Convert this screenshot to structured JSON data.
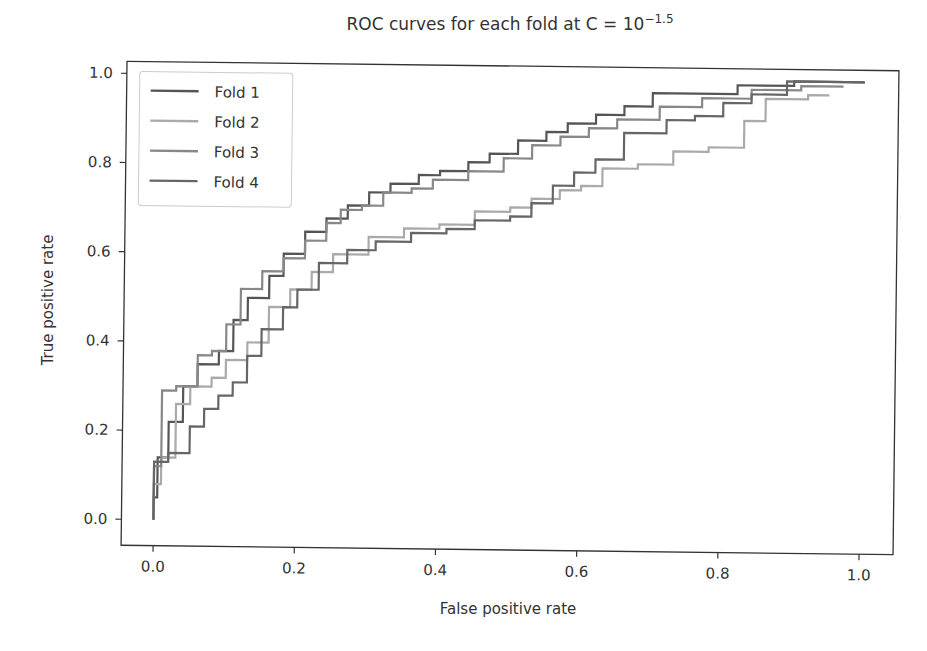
{
  "chart_data": {
    "type": "line",
    "title_parts": {
      "base": "ROC curves for each fold at C = 10",
      "exponent": "−1.5"
    },
    "xlabel": "False positive rate",
    "ylabel": "True positive rate",
    "xlim": [
      -0.05,
      1.04
    ],
    "ylim": [
      -0.05,
      1.05
    ],
    "xticks": [
      0.0,
      0.2,
      0.4,
      0.6,
      0.8,
      1.0
    ],
    "xtick_labels": [
      "0.0",
      "0.2",
      "0.4",
      "0.6",
      "0.8",
      "1.0"
    ],
    "yticks": [
      0.0,
      0.2,
      0.4,
      0.6,
      0.8,
      1.0
    ],
    "ytick_labels": [
      "0.0",
      "0.2",
      "0.4",
      "0.6",
      "0.8",
      "1.0"
    ],
    "grid": false,
    "legend_position": "upper left",
    "series": [
      {
        "name": "Fold 1",
        "color": "#555555",
        "x": [
          0.0,
          0.0,
          0.005,
          0.005,
          0.02,
          0.02,
          0.04,
          0.04,
          0.06,
          0.06,
          0.09,
          0.09,
          0.11,
          0.11,
          0.13,
          0.13,
          0.16,
          0.16,
          0.18,
          0.18,
          0.21,
          0.21,
          0.24,
          0.24,
          0.27,
          0.27,
          0.3,
          0.3,
          0.33,
          0.33,
          0.37,
          0.37,
          0.4,
          0.4,
          0.44,
          0.44,
          0.47,
          0.47,
          0.51,
          0.51,
          0.55,
          0.55,
          0.58,
          0.58,
          0.62,
          0.62,
          0.66,
          0.66,
          0.7,
          0.7,
          0.76,
          0.76,
          0.82,
          0.82,
          0.9,
          0.9,
          1.0
        ],
        "y": [
          0.0,
          0.05,
          0.05,
          0.14,
          0.14,
          0.22,
          0.22,
          0.3,
          0.3,
          0.35,
          0.35,
          0.38,
          0.38,
          0.45,
          0.45,
          0.5,
          0.5,
          0.55,
          0.55,
          0.6,
          0.6,
          0.65,
          0.65,
          0.68,
          0.68,
          0.71,
          0.71,
          0.74,
          0.74,
          0.76,
          0.76,
          0.78,
          0.78,
          0.79,
          0.79,
          0.81,
          0.81,
          0.83,
          0.83,
          0.86,
          0.86,
          0.88,
          0.88,
          0.9,
          0.9,
          0.92,
          0.92,
          0.94,
          0.94,
          0.97,
          0.97,
          0.97,
          0.97,
          0.99,
          0.99,
          1.0,
          1.0
        ]
      },
      {
        "name": "Fold 2",
        "color": "#aaaaaa",
        "x": [
          0.0,
          0.0,
          0.01,
          0.01,
          0.03,
          0.03,
          0.05,
          0.05,
          0.08,
          0.08,
          0.1,
          0.1,
          0.13,
          0.13,
          0.16,
          0.16,
          0.19,
          0.19,
          0.22,
          0.22,
          0.25,
          0.25,
          0.3,
          0.3,
          0.35,
          0.35,
          0.4,
          0.4,
          0.45,
          0.45,
          0.5,
          0.5,
          0.53,
          0.53,
          0.57,
          0.57,
          0.6,
          0.6,
          0.63,
          0.63,
          0.68,
          0.68,
          0.73,
          0.73,
          0.78,
          0.78,
          0.8,
          0.8,
          0.83,
          0.83,
          0.86,
          0.86,
          0.92,
          0.92,
          0.95
        ],
        "y": [
          0.0,
          0.08,
          0.08,
          0.14,
          0.14,
          0.26,
          0.26,
          0.3,
          0.3,
          0.32,
          0.32,
          0.36,
          0.36,
          0.4,
          0.4,
          0.48,
          0.48,
          0.52,
          0.52,
          0.56,
          0.56,
          0.6,
          0.6,
          0.64,
          0.64,
          0.66,
          0.66,
          0.67,
          0.67,
          0.7,
          0.7,
          0.71,
          0.71,
          0.73,
          0.73,
          0.75,
          0.75,
          0.76,
          0.76,
          0.8,
          0.8,
          0.81,
          0.81,
          0.84,
          0.84,
          0.85,
          0.85,
          0.85,
          0.85,
          0.91,
          0.91,
          0.96,
          0.96,
          0.97,
          0.97
        ]
      },
      {
        "name": "Fold 3",
        "color": "#888888",
        "x": [
          0.0,
          0.0,
          0.01,
          0.01,
          0.03,
          0.03,
          0.06,
          0.06,
          0.08,
          0.08,
          0.1,
          0.1,
          0.12,
          0.12,
          0.15,
          0.15,
          0.18,
          0.18,
          0.21,
          0.21,
          0.24,
          0.24,
          0.26,
          0.26,
          0.29,
          0.29,
          0.32,
          0.32,
          0.36,
          0.36,
          0.39,
          0.39,
          0.44,
          0.44,
          0.49,
          0.49,
          0.53,
          0.53,
          0.57,
          0.57,
          0.61,
          0.61,
          0.65,
          0.65,
          0.71,
          0.71,
          0.77,
          0.77,
          0.84,
          0.84,
          0.91,
          0.91,
          0.97
        ],
        "y": [
          0.0,
          0.12,
          0.12,
          0.29,
          0.29,
          0.3,
          0.3,
          0.37,
          0.37,
          0.38,
          0.38,
          0.44,
          0.44,
          0.52,
          0.52,
          0.56,
          0.56,
          0.59,
          0.59,
          0.63,
          0.63,
          0.67,
          0.67,
          0.7,
          0.7,
          0.71,
          0.71,
          0.74,
          0.74,
          0.75,
          0.75,
          0.77,
          0.77,
          0.79,
          0.79,
          0.82,
          0.82,
          0.85,
          0.85,
          0.87,
          0.87,
          0.89,
          0.89,
          0.91,
          0.91,
          0.94,
          0.94,
          0.96,
          0.96,
          0.98,
          0.98,
          0.99,
          0.99
        ]
      },
      {
        "name": "Fold 4",
        "color": "#666666",
        "x": [
          0.0,
          0.0,
          0.02,
          0.02,
          0.05,
          0.05,
          0.07,
          0.07,
          0.09,
          0.09,
          0.11,
          0.11,
          0.13,
          0.13,
          0.15,
          0.15,
          0.18,
          0.18,
          0.2,
          0.2,
          0.23,
          0.23,
          0.27,
          0.27,
          0.31,
          0.31,
          0.36,
          0.36,
          0.41,
          0.41,
          0.45,
          0.45,
          0.5,
          0.5,
          0.53,
          0.53,
          0.56,
          0.56,
          0.59,
          0.59,
          0.62,
          0.62,
          0.66,
          0.66,
          0.72,
          0.72,
          0.76,
          0.76,
          0.8,
          0.8,
          0.84,
          0.84,
          0.89,
          0.89,
          1.0
        ],
        "y": [
          0.0,
          0.13,
          0.13,
          0.15,
          0.15,
          0.21,
          0.21,
          0.25,
          0.25,
          0.28,
          0.28,
          0.31,
          0.31,
          0.37,
          0.37,
          0.43,
          0.43,
          0.48,
          0.48,
          0.52,
          0.52,
          0.58,
          0.58,
          0.61,
          0.61,
          0.63,
          0.63,
          0.65,
          0.65,
          0.66,
          0.66,
          0.68,
          0.68,
          0.69,
          0.69,
          0.72,
          0.72,
          0.76,
          0.76,
          0.79,
          0.79,
          0.82,
          0.82,
          0.88,
          0.88,
          0.91,
          0.91,
          0.92,
          0.92,
          0.95,
          0.95,
          0.97,
          0.97,
          1.0,
          1.0
        ]
      }
    ]
  }
}
